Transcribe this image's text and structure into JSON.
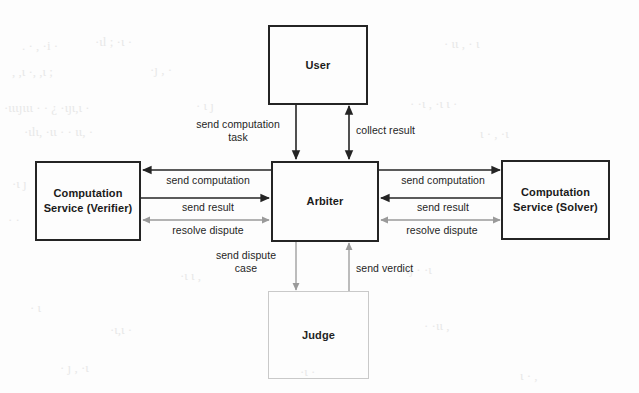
{
  "diagram": {
    "type": "block-diagram",
    "background_color": "#fdfdfd",
    "line_color_primary": "#242424",
    "line_color_secondary": "#9a9a9a",
    "nodes": [
      {
        "id": "user",
        "label": "User",
        "border": "solid"
      },
      {
        "id": "verifier",
        "label": "Computation\nService (Verifier)",
        "border": "solid"
      },
      {
        "id": "arbiter",
        "label": "Arbiter",
        "border": "solid"
      },
      {
        "id": "solver",
        "label": "Computation\nService (Solver)",
        "border": "solid"
      },
      {
        "id": "judge",
        "label": "Judge",
        "border": "faint"
      }
    ],
    "edges": [
      {
        "id": "user-to-arbiter",
        "label": "send computation\ntask",
        "from": "user",
        "to": "arbiter",
        "direction": "down",
        "tone": "dark"
      },
      {
        "id": "arbiter-user-result",
        "label": "collect result",
        "from": "arbiter",
        "to": "user",
        "direction": "both-vert",
        "tone": "dark"
      },
      {
        "id": "arbiter-to-verifier",
        "label": "send computation",
        "from": "arbiter",
        "to": "verifier",
        "direction": "left",
        "tone": "dark"
      },
      {
        "id": "verifier-to-arbiter",
        "label": "send result",
        "from": "verifier",
        "to": "arbiter",
        "direction": "right",
        "tone": "dark"
      },
      {
        "id": "verifier-resolve",
        "label": "resolve dispute",
        "from": "verifier",
        "to": "arbiter",
        "direction": "both-horiz",
        "tone": "light"
      },
      {
        "id": "arbiter-to-solver",
        "label": "send computation",
        "from": "arbiter",
        "to": "solver",
        "direction": "right",
        "tone": "dark"
      },
      {
        "id": "solver-to-arbiter",
        "label": "send result",
        "from": "solver",
        "to": "arbiter",
        "direction": "left",
        "tone": "dark"
      },
      {
        "id": "solver-resolve",
        "label": "resolve dispute",
        "from": "solver",
        "to": "arbiter",
        "direction": "both-horiz",
        "tone": "light"
      },
      {
        "id": "arbiter-to-judge",
        "label": "send dispute\ncase",
        "from": "arbiter",
        "to": "judge",
        "direction": "down",
        "tone": "light"
      },
      {
        "id": "judge-to-arbiter",
        "label": "send verdict",
        "from": "judge",
        "to": "arbiter",
        "direction": "up",
        "tone": "light"
      }
    ]
  }
}
